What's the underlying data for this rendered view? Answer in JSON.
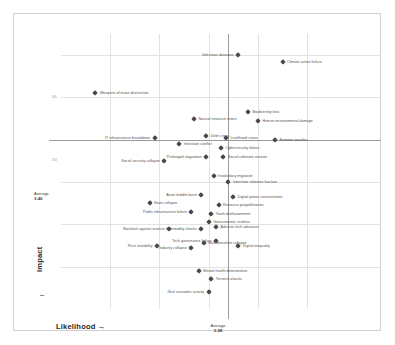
{
  "chart_data": {
    "type": "scatter",
    "title": "",
    "xlabel": "Likelihood",
    "ylabel": "Impact",
    "xlim": [
      2.6,
      3.9
    ],
    "ylim": [
      2.6,
      3.9
    ],
    "grid": true,
    "legend": false,
    "averages": {
      "x_label": "Average",
      "x_value": "3.28",
      "y_label": "Average",
      "y_value": "3.40"
    },
    "points": [
      {
        "name": "Weapons of mass destruction",
        "x": 2.74,
        "y": 3.62,
        "label_side": "right"
      },
      {
        "name": "Infectious diseases",
        "x": 3.32,
        "y": 3.8,
        "label_side": "left"
      },
      {
        "name": "Climate action failure",
        "x": 3.5,
        "y": 3.77,
        "label_side": "right"
      },
      {
        "name": "Biodiversity loss",
        "x": 3.36,
        "y": 3.53,
        "label_side": "right"
      },
      {
        "name": "Human environmental damage",
        "x": 3.4,
        "y": 3.49,
        "label_side": "right"
      },
      {
        "name": "Natural resource crises",
        "x": 3.14,
        "y": 3.5,
        "label_side": "right"
      },
      {
        "name": "IT infrastructure breakdown",
        "x": 2.98,
        "y": 3.41,
        "label_side": "left"
      },
      {
        "name": "Interstate conflict",
        "x": 3.08,
        "y": 3.38,
        "label_side": "right"
      },
      {
        "name": "Debt crises",
        "x": 3.19,
        "y": 3.42,
        "label_side": "right"
      },
      {
        "name": "Livelihood crises",
        "x": 3.27,
        "y": 3.41,
        "label_side": "right"
      },
      {
        "name": "Extreme weather",
        "x": 3.47,
        "y": 3.4,
        "label_side": "right"
      },
      {
        "name": "Cybersecurity failure",
        "x": 3.25,
        "y": 3.36,
        "label_side": "right"
      },
      {
        "name": "Social cohesion erosion",
        "x": 3.26,
        "y": 3.32,
        "label_side": "right"
      },
      {
        "name": "Prolonged stagnation",
        "x": 3.19,
        "y": 3.32,
        "label_side": "left"
      },
      {
        "name": "Social security collapse",
        "x": 3.02,
        "y": 3.3,
        "label_side": "left"
      },
      {
        "name": "Involuntary migration",
        "x": 3.22,
        "y": 3.23,
        "label_side": "right"
      },
      {
        "name": "Interstate relations fracture",
        "x": 3.28,
        "y": 3.2,
        "label_side": "right"
      },
      {
        "name": "Asset bubble burst",
        "x": 3.17,
        "y": 3.14,
        "label_side": "left"
      },
      {
        "name": "Digital power concentration",
        "x": 3.3,
        "y": 3.13,
        "label_side": "right"
      },
      {
        "name": "Resource geopolitisation",
        "x": 3.24,
        "y": 3.09,
        "label_side": "right"
      },
      {
        "name": "Public infrastructure failure",
        "x": 3.13,
        "y": 3.06,
        "label_side": "left"
      },
      {
        "name": "Youth disillusionment",
        "x": 3.21,
        "y": 3.05,
        "label_side": "right"
      },
      {
        "name": "State collapse",
        "x": 2.96,
        "y": 3.1,
        "label_side": "right"
      },
      {
        "name": "Geoeconomic rivalries",
        "x": 3.2,
        "y": 3.01,
        "label_side": "right"
      },
      {
        "name": "Backlash against science",
        "x": 3.04,
        "y": 2.98,
        "label_side": "left"
      },
      {
        "name": "Commodity shocks",
        "x": 3.17,
        "y": 2.98,
        "label_side": "left"
      },
      {
        "name": "Adverse tech advances",
        "x": 3.23,
        "y": 2.99,
        "label_side": "right"
      },
      {
        "name": "Tech governance failure",
        "x": 3.23,
        "y": 2.92,
        "label_side": "left"
      },
      {
        "name": "Digital inequality",
        "x": 3.32,
        "y": 2.9,
        "label_side": "right"
      },
      {
        "name": "Price instability",
        "x": 2.99,
        "y": 2.9,
        "label_side": "left"
      },
      {
        "name": "Industry collapse",
        "x": 3.13,
        "y": 2.89,
        "label_side": "left"
      },
      {
        "name": "Multilateralism collapse",
        "x": 3.18,
        "y": 2.91,
        "label_side": "right"
      },
      {
        "name": "Mental health deterioration",
        "x": 3.16,
        "y": 2.78,
        "label_side": "right"
      },
      {
        "name": "Terrorist attacks",
        "x": 3.21,
        "y": 2.74,
        "label_side": "right"
      },
      {
        "name": "Illicit economic activity",
        "x": 3.2,
        "y": 2.68,
        "label_side": "left"
      }
    ],
    "x_gridlines": [
      2.8,
      3.0,
      3.2,
      3.4,
      3.6
    ],
    "y_gridlines": [
      2.8,
      3.0,
      3.2,
      3.4,
      3.6,
      3.8
    ],
    "y_ticks": [
      {
        "value": 3.6,
        "text": "3.6"
      },
      {
        "value": 3.3,
        "text": "3.3"
      }
    ]
  }
}
